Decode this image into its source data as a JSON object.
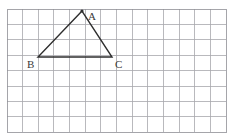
{
  "figure": {
    "title": "",
    "background_color": "#ffffff",
    "grid": {
      "name": "square-grid",
      "columns": 14,
      "rows": 8,
      "origin_x": 7,
      "origin_y": 9,
      "cell_width": 15.65,
      "cell_height": 15.4,
      "line_color": "#a8a8ad",
      "border_color": "#8f8f95",
      "line_width": 0.8
    },
    "triangle": {
      "name": "triangle-abc",
      "stroke_color": "#2e2e2e",
      "stroke_width": 1.4,
      "fill": "none",
      "vertices": [
        {
          "label": "A",
          "x": 82,
          "y": 11,
          "label_x": 88,
          "label_y": 11
        },
        {
          "label": "B",
          "x": 38,
          "y": 57,
          "label_x": 27,
          "label_y": 59
        },
        {
          "label": "C",
          "x": 112,
          "y": 57,
          "label_x": 115,
          "label_y": 59
        }
      ],
      "edges": [
        "AB",
        "BC",
        "CA"
      ]
    },
    "labels": {
      "a": "A",
      "b": "B",
      "c": "C"
    }
  }
}
